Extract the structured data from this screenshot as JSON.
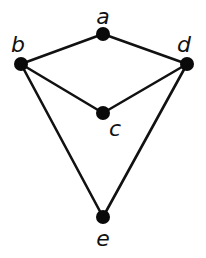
{
  "diagram": {
    "type": "graph",
    "directed": false,
    "colors": {
      "background": "#ffffff",
      "edge": "#111111",
      "node": "#0a0a0a",
      "label": "#111111"
    },
    "nodes": [
      {
        "id": "a",
        "label": "a",
        "x": 103,
        "y": 34,
        "label_x": 103,
        "label_y": 24
      },
      {
        "id": "b",
        "label": "b",
        "x": 21,
        "y": 64,
        "label_x": 18,
        "label_y": 52
      },
      {
        "id": "d",
        "label": "d",
        "x": 187,
        "y": 64,
        "label_x": 184,
        "label_y": 52
      },
      {
        "id": "c",
        "label": "c",
        "x": 103,
        "y": 113,
        "label_x": 115,
        "label_y": 136
      },
      {
        "id": "e",
        "label": "e",
        "x": 103,
        "y": 217,
        "label_x": 103,
        "label_y": 246
      }
    ],
    "edges": [
      {
        "from": "a",
        "to": "b"
      },
      {
        "from": "a",
        "to": "d"
      },
      {
        "from": "b",
        "to": "c"
      },
      {
        "from": "c",
        "to": "d"
      },
      {
        "from": "b",
        "to": "e"
      },
      {
        "from": "d",
        "to": "e"
      }
    ]
  }
}
